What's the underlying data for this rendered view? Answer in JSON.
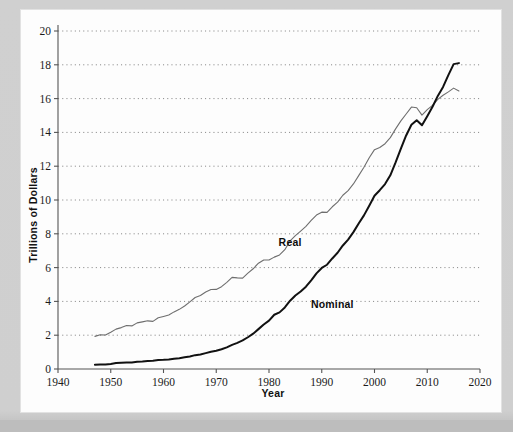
{
  "figure": {
    "background_color": "#fdfdfd",
    "frame_color": "#cfcfcf"
  },
  "chart_data": {
    "type": "line",
    "title": "",
    "xlabel": "Year",
    "ylabel": "Trillions of Dollars",
    "xlim": [
      1940,
      2020
    ],
    "ylim": [
      0,
      20
    ],
    "xticks": [
      1940,
      1950,
      1960,
      1970,
      1980,
      1990,
      2000,
      2010,
      2020
    ],
    "yticks": [
      0,
      2,
      4,
      6,
      8,
      10,
      12,
      14,
      16,
      18,
      20
    ],
    "grid": "horizontal-dotted",
    "legend_position": "inline-annotations",
    "annotations": [
      {
        "text": "Real",
        "x": 1984,
        "y": 7.3
      },
      {
        "text": "Nominal",
        "x": 1992,
        "y": 3.6
      }
    ],
    "series": [
      {
        "name": "Real",
        "color": "#6e6e6e",
        "linewidth": 1.1,
        "x": [
          1947,
          1948,
          1949,
          1950,
          1951,
          1952,
          1953,
          1954,
          1955,
          1956,
          1957,
          1958,
          1959,
          1960,
          1961,
          1962,
          1963,
          1964,
          1965,
          1966,
          1967,
          1968,
          1969,
          1970,
          1971,
          1972,
          1973,
          1974,
          1975,
          1976,
          1977,
          1978,
          1979,
          1980,
          1981,
          1982,
          1983,
          1984,
          1985,
          1986,
          1987,
          1988,
          1989,
          1990,
          1991,
          1992,
          1993,
          1994,
          1995,
          1996,
          1997,
          1998,
          1999,
          2000,
          2001,
          2002,
          2003,
          2004,
          2005,
          2006,
          2007,
          2008,
          2009,
          2010,
          2011,
          2012,
          2013,
          2014,
          2015,
          2016
        ],
        "y": [
          1.93,
          2.03,
          2.01,
          2.18,
          2.36,
          2.45,
          2.57,
          2.55,
          2.73,
          2.79,
          2.85,
          2.82,
          3.03,
          3.11,
          3.19,
          3.38,
          3.53,
          3.73,
          3.97,
          4.23,
          4.35,
          4.56,
          4.7,
          4.71,
          4.87,
          5.13,
          5.42,
          5.39,
          5.38,
          5.67,
          5.93,
          6.26,
          6.45,
          6.45,
          6.62,
          6.75,
          7.06,
          7.58,
          7.89,
          8.16,
          8.44,
          8.79,
          9.11,
          9.28,
          9.27,
          9.6,
          9.87,
          10.28,
          10.55,
          10.95,
          11.44,
          11.94,
          12.5,
          12.98,
          13.11,
          13.33,
          13.69,
          14.21,
          14.68,
          15.09,
          15.5,
          15.46,
          15.02,
          15.35,
          15.6,
          15.95,
          16.2,
          16.4,
          16.62,
          16.45
        ],
        "units": "Trillions of chained dollars"
      },
      {
        "name": "Nominal",
        "color": "#111111",
        "linewidth": 2.0,
        "x": [
          1947,
          1948,
          1949,
          1950,
          1951,
          1952,
          1953,
          1954,
          1955,
          1956,
          1957,
          1958,
          1959,
          1960,
          1961,
          1962,
          1963,
          1964,
          1965,
          1966,
          1967,
          1968,
          1969,
          1970,
          1971,
          1972,
          1973,
          1974,
          1975,
          1976,
          1977,
          1978,
          1979,
          1980,
          1981,
          1982,
          1983,
          1984,
          1985,
          1986,
          1987,
          1988,
          1989,
          1990,
          1991,
          1992,
          1993,
          1994,
          1995,
          1996,
          1997,
          1998,
          1999,
          2000,
          2001,
          2002,
          2003,
          2004,
          2005,
          2006,
          2007,
          2008,
          2009,
          2010,
          2011,
          2012,
          2013,
          2014,
          2015,
          2016
        ],
        "y": [
          0.25,
          0.27,
          0.27,
          0.3,
          0.35,
          0.37,
          0.39,
          0.39,
          0.43,
          0.45,
          0.48,
          0.49,
          0.53,
          0.54,
          0.56,
          0.61,
          0.64,
          0.69,
          0.74,
          0.82,
          0.86,
          0.94,
          1.02,
          1.08,
          1.17,
          1.28,
          1.43,
          1.55,
          1.69,
          1.88,
          2.09,
          2.36,
          2.63,
          2.86,
          3.21,
          3.35,
          3.64,
          4.04,
          4.35,
          4.59,
          4.87,
          5.25,
          5.66,
          5.98,
          6.17,
          6.54,
          6.88,
          7.31,
          7.66,
          8.1,
          8.61,
          9.09,
          9.66,
          10.25,
          10.58,
          10.94,
          11.46,
          12.22,
          13.04,
          13.82,
          14.45,
          14.72,
          14.42,
          14.96,
          15.52,
          16.16,
          16.69,
          17.39,
          18.04,
          18.1
        ],
        "units": "Trillions of current dollars"
      }
    ]
  },
  "axes": {
    "x_axis_name": "year-axis",
    "y_axis_name": "dollars-axis"
  }
}
